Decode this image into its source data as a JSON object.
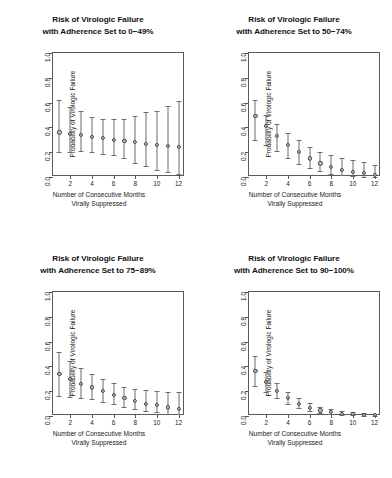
{
  "figure": {
    "axis_labels": {
      "y": "Probability of Virologic Failure",
      "x": "Number of Consecutive Months\nVirally Suppressed"
    },
    "y_ticks": [
      "0.0",
      "0.2",
      "0.4",
      "0.6",
      "0.8",
      "1.0"
    ],
    "y_tick_values": [
      0.0,
      0.2,
      0.4,
      0.6,
      0.8,
      1.0
    ],
    "x_ticks": [
      "2",
      "4",
      "6",
      "8",
      "10",
      "12"
    ],
    "x_tick_values": [
      2,
      4,
      6,
      8,
      10,
      12
    ],
    "colors": {
      "marker_fill": "#b9b9b9",
      "marker_stroke": "#4a4a4a",
      "errorbar": "#6d6d6d",
      "axis": "#5a5a5a",
      "text": "#1a1a1a",
      "background": "#ffffff"
    }
  },
  "chart_data": [
    {
      "type": "scatter",
      "panel": "top-left",
      "title": "Risk of Virologic Failure\nwith Adherence Set to 0−49%",
      "xlabel": "Number of Consecutive Months Virally Suppressed",
      "ylabel": "Probability of Virologic Failure",
      "xlim": [
        0.4,
        12.6
      ],
      "ylim": [
        0.0,
        1.0
      ],
      "grid": false,
      "legend": null,
      "x": [
        1,
        2,
        3,
        4,
        5,
        6,
        7,
        8,
        9,
        10,
        11,
        12
      ],
      "values": [
        0.36,
        0.35,
        0.34,
        0.325,
        0.315,
        0.3,
        0.29,
        0.28,
        0.27,
        0.26,
        0.25,
        0.24
      ],
      "ci_lower": [
        0.2,
        0.205,
        0.21,
        0.2,
        0.185,
        0.175,
        0.15,
        0.115,
        0.085,
        0.055,
        0.04,
        0.025
      ],
      "ci_upper": [
        0.625,
        0.565,
        0.535,
        0.48,
        0.47,
        0.47,
        0.465,
        0.49,
        0.525,
        0.535,
        0.575,
        0.61
      ]
    },
    {
      "type": "scatter",
      "panel": "top-right",
      "title": "Risk of Virologic Failure\nwith Adherence Set to 50−74%",
      "xlabel": "Number of Consecutive Months Virally Suppressed",
      "ylabel": "Probability of Virologic Failure",
      "xlim": [
        0.4,
        12.6
      ],
      "ylim": [
        0.0,
        1.0
      ],
      "grid": false,
      "legend": null,
      "x": [
        1,
        2,
        3,
        4,
        5,
        6,
        7,
        8,
        9,
        10,
        11,
        12
      ],
      "values": [
        0.49,
        0.41,
        0.33,
        0.26,
        0.2,
        0.15,
        0.11,
        0.08,
        0.055,
        0.04,
        0.03,
        0.015
      ],
      "ci_lower": [
        0.295,
        0.255,
        0.21,
        0.155,
        0.105,
        0.07,
        0.045,
        0.025,
        0.015,
        0.005,
        0.0,
        0.0
      ],
      "ci_upper": [
        0.62,
        0.5,
        0.425,
        0.355,
        0.295,
        0.245,
        0.205,
        0.175,
        0.15,
        0.135,
        0.12,
        0.1
      ]
    },
    {
      "type": "scatter",
      "panel": "bottom-left",
      "title": "Risk of Virologic Failure\nwith Adherence Set to 75−89%",
      "xlabel": "Number of Consecutive Months Virally Suppressed",
      "ylabel": "Probability of Virologic Failure",
      "xlim": [
        0.4,
        12.6
      ],
      "ylim": [
        0.0,
        1.0
      ],
      "grid": false,
      "legend": null,
      "x": [
        1,
        2,
        3,
        4,
        5,
        6,
        7,
        8,
        9,
        10,
        11,
        12
      ],
      "values": [
        0.34,
        0.3,
        0.26,
        0.23,
        0.2,
        0.17,
        0.145,
        0.125,
        0.1,
        0.09,
        0.07,
        0.06
      ],
      "ci_lower": [
        0.165,
        0.155,
        0.145,
        0.135,
        0.115,
        0.095,
        0.075,
        0.055,
        0.04,
        0.03,
        0.02,
        0.015
      ],
      "ci_upper": [
        0.515,
        0.44,
        0.385,
        0.335,
        0.295,
        0.265,
        0.235,
        0.22,
        0.21,
        0.2,
        0.195,
        0.19
      ]
    },
    {
      "type": "scatter",
      "panel": "bottom-right",
      "title": "Risk of Virologic Failure\nwith Adherence Set to 90−100%",
      "xlabel": "Number of Consecutive Months Virally Suppressed",
      "ylabel": "Probability of Virologic Failure",
      "xlim": [
        0.4,
        12.6
      ],
      "ylim": [
        0.0,
        1.0
      ],
      "grid": false,
      "legend": null,
      "x": [
        1,
        2,
        3,
        4,
        5,
        6,
        7,
        8,
        9,
        10,
        11,
        12
      ],
      "values": [
        0.365,
        0.275,
        0.205,
        0.145,
        0.1,
        0.065,
        0.045,
        0.03,
        0.02,
        0.015,
        0.01,
        0.008
      ],
      "ci_lower": [
        0.245,
        0.195,
        0.145,
        0.1,
        0.065,
        0.04,
        0.025,
        0.015,
        0.008,
        0.005,
        0.003,
        0.002
      ],
      "ci_upper": [
        0.48,
        0.355,
        0.265,
        0.195,
        0.145,
        0.105,
        0.075,
        0.055,
        0.04,
        0.03,
        0.025,
        0.02
      ]
    }
  ]
}
